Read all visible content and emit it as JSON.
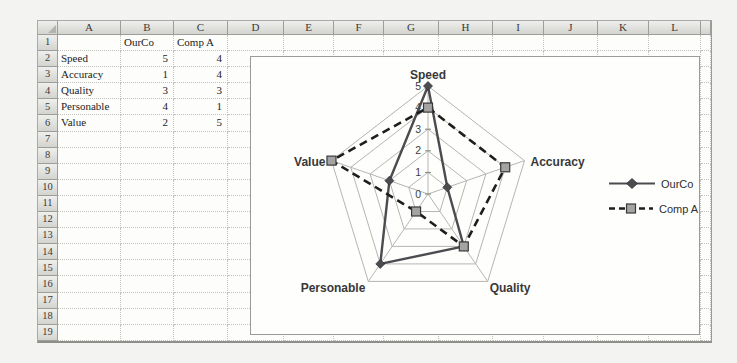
{
  "spreadsheet": {
    "column_headers": [
      "A",
      "B",
      "C",
      "D",
      "E",
      "F",
      "G",
      "H",
      "I",
      "J",
      "K",
      "L"
    ],
    "visible_row_count": 19,
    "cells": {
      "B1": "OurCo",
      "C1": "Comp A",
      "A2": "Speed",
      "B2": "5",
      "C2": "4",
      "A3": "Accuracy",
      "B3": "1",
      "C3": "4",
      "A4": "Quality",
      "B4": "3",
      "C4": "3",
      "A5": "Personable",
      "B5": "4",
      "C5": "1",
      "A6": "Value",
      "B6": "2",
      "C6": "5"
    }
  },
  "chart_data": {
    "type": "radar",
    "categories": [
      "Speed",
      "Accuracy",
      "Quality",
      "Personable",
      "Value"
    ],
    "series": [
      {
        "name": "OurCo",
        "values": [
          5,
          1,
          3,
          4,
          2
        ],
        "line_style": "solid",
        "marker": "diamond",
        "color": "#4c4c50"
      },
      {
        "name": "Comp A",
        "values": [
          4,
          4,
          3,
          1,
          5
        ],
        "line_style": "dashed",
        "marker": "square",
        "color": "#1e1e1e"
      }
    ],
    "axis": {
      "min": 0,
      "max": 5,
      "ticks": [
        0,
        1,
        2,
        3,
        4,
        5
      ]
    },
    "legend_position": "right",
    "grid_color": "#b5b5b1",
    "marker_fill_square": "#a4a4a2",
    "title": ""
  }
}
